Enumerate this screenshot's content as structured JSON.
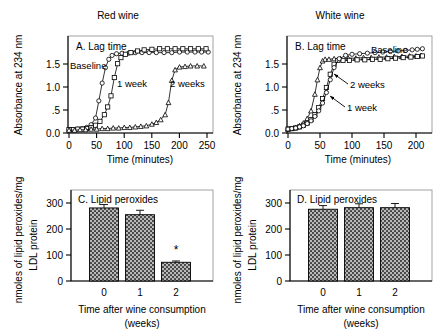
{
  "figure": {
    "panel_titles": {
      "left": "Red wine",
      "right": "White wine"
    }
  },
  "chart_data": [
    {
      "id": "A",
      "type": "line",
      "title": "Red wine",
      "panel_label": "A. Lag time",
      "xlabel": "Time (minutes)",
      "ylabel": "Absorbance at 234 nm",
      "xlim": [
        0,
        270
      ],
      "ylim": [
        0.0,
        1.75
      ],
      "xticks": [
        0,
        50,
        100,
        150,
        200,
        250
      ],
      "xticklabels": [
        "0",
        "50",
        "100",
        "150",
        "200",
        "250"
      ],
      "yticks": [
        0.0,
        0.5,
        1.0,
        1.5
      ],
      "yticklabels": [
        "0.0",
        ".5",
        "1.0",
        "1.5"
      ],
      "grid": false,
      "legend_position": "inline-annotations",
      "annotations": [
        {
          "text": "Baseline",
          "x": 6,
          "y": 1.44
        },
        {
          "text": "1 week",
          "x": 98,
          "y": 1.12
        },
        {
          "text": "2 weeks",
          "x": 195,
          "y": 1.12
        }
      ],
      "series": [
        {
          "name": "Baseline",
          "marker": "circle",
          "x": [
            0,
            8,
            16,
            24,
            32,
            40,
            48,
            54,
            60,
            66,
            72,
            78,
            86,
            96,
            108,
            120,
            132,
            145,
            158,
            172,
            186,
            200,
            214,
            228,
            240,
            252
          ],
          "y": [
            0.06,
            0.06,
            0.07,
            0.08,
            0.1,
            0.15,
            0.27,
            0.58,
            0.9,
            1.18,
            1.33,
            1.4,
            1.43,
            1.44,
            1.44,
            1.45,
            1.45,
            1.45,
            1.45,
            1.45,
            1.45,
            1.46,
            1.46,
            1.46,
            1.46,
            1.46
          ]
        },
        {
          "name": "1 week",
          "marker": "square",
          "x": [
            0,
            8,
            16,
            24,
            32,
            40,
            48,
            56,
            64,
            70,
            76,
            82,
            88,
            94,
            102,
            112,
            124,
            136,
            150,
            164,
            178,
            192,
            206,
            220,
            234,
            248
          ],
          "y": [
            0.06,
            0.06,
            0.07,
            0.07,
            0.08,
            0.1,
            0.14,
            0.21,
            0.33,
            0.47,
            0.67,
            1.0,
            1.25,
            1.36,
            1.42,
            1.45,
            1.48,
            1.5,
            1.51,
            1.52,
            1.52,
            1.52,
            1.52,
            1.52,
            1.52,
            1.52
          ]
        },
        {
          "name": "2 weeks",
          "marker": "triangle",
          "x": [
            0,
            10,
            20,
            30,
            40,
            50,
            60,
            70,
            80,
            90,
            100,
            110,
            120,
            130,
            140,
            150,
            158,
            166,
            174,
            180,
            186,
            192,
            200,
            210,
            220,
            232,
            244
          ],
          "y": [
            0.05,
            0.05,
            0.06,
            0.06,
            0.07,
            0.07,
            0.08,
            0.08,
            0.09,
            0.09,
            0.1,
            0.1,
            0.11,
            0.12,
            0.13,
            0.16,
            0.19,
            0.24,
            0.33,
            0.55,
            0.95,
            1.14,
            1.19,
            1.2,
            1.21,
            1.21,
            1.21
          ]
        }
      ]
    },
    {
      "id": "B",
      "type": "line",
      "title": "White wine",
      "panel_label": "B. Lag time",
      "xlabel": "Time (minutes)",
      "ylabel": "Absorbance at 234 nm",
      "xlim": [
        0,
        225
      ],
      "ylim": [
        0.0,
        1.75
      ],
      "xticks": [
        0,
        50,
        100,
        150,
        200
      ],
      "xticklabels": [
        "0",
        "50",
        "100",
        "150",
        "200"
      ],
      "yticks": [
        0.0,
        0.5,
        1.0,
        1.5
      ],
      "yticklabels": [
        "0.0",
        ".5",
        "1.0",
        "1.5"
      ],
      "grid": false,
      "legend_position": "inline-annotations",
      "annotations": [
        {
          "text": "Baseline",
          "x": 128,
          "y": 1.57
        },
        {
          "text": "2 weeks",
          "x": 92,
          "y": 1.0
        },
        {
          "text": "1 week",
          "x": 88,
          "y": 0.56
        }
      ],
      "series": [
        {
          "name": "2 weeks",
          "marker": "triangle",
          "x": [
            0,
            6,
            12,
            18,
            24,
            30,
            36,
            42,
            46,
            50,
            54,
            58,
            64,
            72,
            82,
            94,
            106,
            118,
            130,
            142,
            154,
            166,
            178,
            190,
            200,
            208
          ],
          "y": [
            0.07,
            0.08,
            0.1,
            0.13,
            0.18,
            0.26,
            0.4,
            0.7,
            0.96,
            1.18,
            1.3,
            1.33,
            1.33,
            1.34,
            1.34,
            1.35,
            1.35,
            1.36,
            1.36,
            1.37,
            1.37,
            1.38,
            1.38,
            1.39,
            1.39,
            1.4
          ]
        },
        {
          "name": "1 week",
          "marker": "square",
          "x": [
            0,
            6,
            12,
            18,
            24,
            30,
            36,
            42,
            48,
            54,
            60,
            66,
            72,
            78,
            86,
            96,
            108,
            120,
            132,
            144,
            156,
            168,
            180,
            192,
            202,
            210
          ],
          "y": [
            0.07,
            0.08,
            0.09,
            0.11,
            0.14,
            0.18,
            0.24,
            0.33,
            0.46,
            0.62,
            0.82,
            1.06,
            1.24,
            1.31,
            1.31,
            1.31,
            1.32,
            1.32,
            1.33,
            1.33,
            1.34,
            1.35,
            1.36,
            1.37,
            1.38,
            1.39
          ]
        },
        {
          "name": "Baseline",
          "marker": "circle",
          "x": [
            0,
            6,
            12,
            18,
            24,
            30,
            36,
            42,
            48,
            54,
            60,
            66,
            72,
            80,
            90,
            100,
            112,
            124,
            136,
            148,
            160,
            172,
            184,
            194,
            202,
            210
          ],
          "y": [
            0.07,
            0.08,
            0.09,
            0.11,
            0.13,
            0.17,
            0.22,
            0.3,
            0.4,
            0.54,
            0.73,
            0.96,
            1.18,
            1.34,
            1.4,
            1.42,
            1.43,
            1.44,
            1.45,
            1.46,
            1.47,
            1.48,
            1.49,
            1.5,
            1.51,
            1.52
          ]
        }
      ]
    },
    {
      "id": "C",
      "type": "bar",
      "panel_label": "C. Lipid peroxides",
      "xlabel": "Time after wine consumption",
      "xlabel2": "(weeks)",
      "ylabel": "nmoles of lipid peroxides/mg",
      "ylabel2": "LDL protein",
      "categories": [
        "0",
        "1",
        "2"
      ],
      "values": [
        281,
        255,
        72
      ],
      "errors": [
        13,
        17,
        5
      ],
      "significance": [
        "",
        "",
        "*"
      ],
      "yticks": [
        0,
        100,
        200,
        300
      ],
      "yticklabels": [
        "0",
        "100",
        "200",
        "300"
      ],
      "ylim": [
        0,
        350
      ],
      "grid": false
    },
    {
      "id": "D",
      "type": "bar",
      "panel_label": "D. Lipid peroxides",
      "xlabel": "Time after wine consumption",
      "xlabel2": "(weeks)",
      "ylabel": "nmoles of lipid peroxides/mg",
      "ylabel2": "LDL protein",
      "categories": [
        "0",
        "1",
        "2"
      ],
      "values": [
        276,
        282,
        282
      ],
      "errors": [
        14,
        15,
        16
      ],
      "significance": [
        "",
        "",
        ""
      ],
      "yticks": [
        0,
        100,
        200,
        300
      ],
      "yticklabels": [
        "0",
        "100",
        "200",
        "300"
      ],
      "ylim": [
        0,
        350
      ],
      "grid": false
    }
  ]
}
